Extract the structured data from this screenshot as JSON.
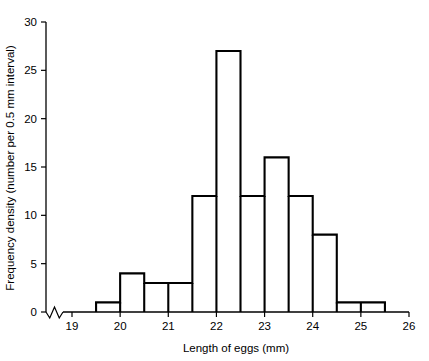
{
  "chart_data": {
    "type": "bar",
    "title": "",
    "subtitle": "",
    "xlabel": "Length of eggs (mm)",
    "ylabel": "Frequency density (number per 0.5 mm interval)",
    "xlim": [
      18.6,
      26
    ],
    "ylim": [
      0,
      30
    ],
    "grid": false,
    "legend": null,
    "axis_break": "x-axis break between 0 and 19",
    "bin_width": 0.5,
    "x_ticks": [
      "19",
      "20",
      "21",
      "22",
      "23",
      "24",
      "25",
      "26"
    ],
    "x_tick_values": [
      19,
      20,
      21,
      22,
      23,
      24,
      25,
      26
    ],
    "y_ticks": [
      "0",
      "5",
      "10",
      "15",
      "20",
      "25",
      "30"
    ],
    "y_tick_values": [
      0,
      5,
      10,
      15,
      20,
      25,
      30
    ],
    "categories": [
      "19.5-20.0",
      "20.0-20.5",
      "20.5-21.0",
      "21.0-21.5",
      "21.5-22.0",
      "22.0-22.5",
      "22.5-23.0",
      "23.0-23.5",
      "23.5-24.0",
      "24.0-24.5",
      "24.5-25.0",
      "25.0-25.5"
    ],
    "bins": [
      {
        "start": 19.5,
        "end": 20.0,
        "value": 1
      },
      {
        "start": 20.0,
        "end": 20.5,
        "value": 4
      },
      {
        "start": 20.5,
        "end": 21.0,
        "value": 3
      },
      {
        "start": 21.0,
        "end": 21.5,
        "value": 3
      },
      {
        "start": 21.5,
        "end": 22.0,
        "value": 12
      },
      {
        "start": 22.0,
        "end": 22.5,
        "value": 27
      },
      {
        "start": 22.5,
        "end": 23.0,
        "value": 12
      },
      {
        "start": 23.0,
        "end": 23.5,
        "value": 16
      },
      {
        "start": 23.5,
        "end": 24.0,
        "value": 12
      },
      {
        "start": 24.0,
        "end": 24.5,
        "value": 8
      },
      {
        "start": 24.5,
        "end": 25.0,
        "value": 1
      },
      {
        "start": 25.0,
        "end": 25.5,
        "value": 1
      }
    ],
    "values": [
      1,
      4,
      3,
      3,
      12,
      27,
      12,
      16,
      12,
      8,
      1,
      1
    ],
    "colors": {
      "bar_stroke": "#000000",
      "bar_fill": "none",
      "axis": "#000000",
      "background": "#ffffff"
    }
  }
}
